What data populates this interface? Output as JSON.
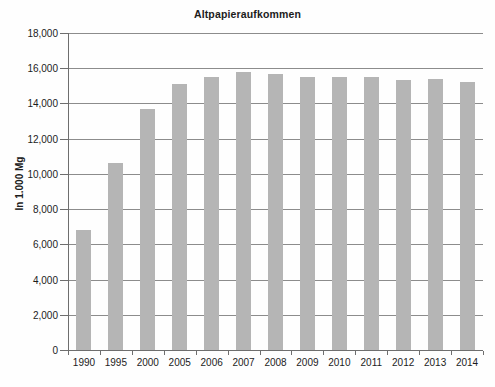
{
  "chart_data": {
    "type": "bar",
    "title": "Altpapieraufkommen",
    "xlabel": "",
    "ylabel": "In 1.000 Mg",
    "categories": [
      "1990",
      "1995",
      "2000",
      "2005",
      "2006",
      "2007",
      "2008",
      "2009",
      "2010",
      "2011",
      "2012",
      "2013",
      "2014"
    ],
    "values": [
      6800,
      10600,
      13700,
      15100,
      15500,
      15800,
      15700,
      15500,
      15500,
      15500,
      15350,
      15400,
      15200
    ],
    "series": [
      {
        "name": "Altpapieraufkommen",
        "values": [
          6800,
          10600,
          13700,
          15100,
          15500,
          15800,
          15700,
          15500,
          15500,
          15500,
          15350,
          15400,
          15200
        ]
      }
    ],
    "ylim": [
      0,
      18000
    ],
    "ytick_step": 2000,
    "yticks": [
      0,
      2000,
      4000,
      6000,
      8000,
      10000,
      12000,
      14000,
      16000,
      18000
    ],
    "ytick_labels": [
      "0",
      "2,000",
      "4,000",
      "6,000",
      "8,000",
      "10,000",
      "12,000",
      "14,000",
      "16,000",
      "18,000"
    ],
    "grid": true,
    "grid_axis": "y",
    "legend": false,
    "legend_position": "none",
    "bar_color": "#b5b5b5",
    "axis_color": "#6e6e6e",
    "grid_color": "#8c8c8c",
    "background_color": "#fefefe",
    "title_color": "#1c1c1c"
  }
}
